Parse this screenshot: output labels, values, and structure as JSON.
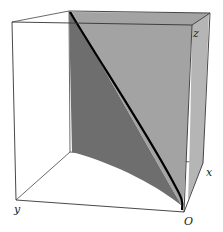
{
  "figure": {
    "axis_labels": {
      "x": "x",
      "y": "y",
      "z": "z",
      "origin": "O"
    },
    "colors": {
      "box_edge": "#333333",
      "surface_light": "#a0a0a0",
      "surface_dark": "#6e6e6e",
      "curve": "#000000",
      "background": "#ffffff"
    }
  }
}
